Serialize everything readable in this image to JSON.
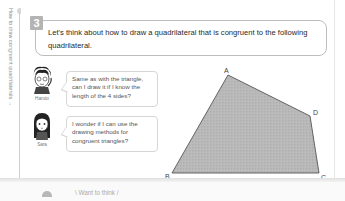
{
  "side": {
    "label": "How to draw congruent quadrilaterals →"
  },
  "question": {
    "number": "3",
    "text": "Let's think about how to draw a quadrilateral that is congruent to the following quadrilateral."
  },
  "dialogue": [
    {
      "speaker": "Haruto",
      "text": "Same as with the triangle, can I draw it if I know the length of the 4 sides?"
    },
    {
      "speaker": "Sara",
      "text": "I wonder if I can use the drawing methods for congruent triangles?"
    }
  ],
  "figure": {
    "shape": "quadrilateral",
    "fill": "#b9b9b9",
    "stroke": "#555555",
    "vertices": [
      {
        "label": "A",
        "x": 228,
        "y": 75
      },
      {
        "label": "B",
        "x": 172,
        "y": 173
      },
      {
        "label": "C",
        "x": 319,
        "y": 173
      },
      {
        "label": "D",
        "x": 310,
        "y": 116
      }
    ]
  },
  "next_section": {
    "text": "\\ Want to think /"
  }
}
